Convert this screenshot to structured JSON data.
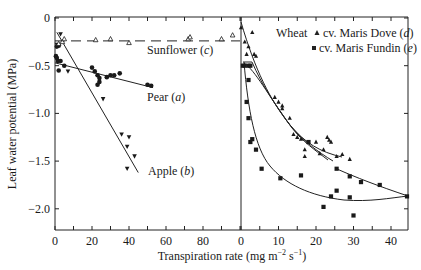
{
  "chart_data": {
    "type": "scatter",
    "title": "",
    "xlabel": "Transpiration rate (mg m⁻² s⁻¹)",
    "ylabel": "Leaf water potential (MPa)",
    "ylim": [
      -2.22,
      0
    ],
    "yticks": [
      0,
      -0.5,
      -1.0,
      -1.5,
      -2.0
    ],
    "ytick_labels": [
      "0",
      "−0.5",
      "−1.0",
      "−1.5",
      "−2.0"
    ],
    "grid": false,
    "panels": [
      {
        "name": "left",
        "xlim": [
          0,
          100
        ],
        "xticks": [
          0,
          20,
          40,
          60,
          80
        ],
        "xtick_labels": [
          "0",
          "20",
          "40",
          "60",
          "80"
        ],
        "series": [
          {
            "name": "Pear (a)",
            "marker": "circle-filled",
            "fit": "line",
            "fit_line": [
              [
                0,
                -0.47
              ],
              [
                53,
                -0.73
              ]
            ],
            "points": [
              [
                1,
                -0.3
              ],
              [
                2,
                -0.29
              ],
              [
                0.5,
                -0.4
              ],
              [
                1,
                -0.42
              ],
              [
                1.5,
                -0.45
              ],
              [
                3,
                -0.45
              ],
              [
                2,
                -0.55
              ],
              [
                5,
                -0.5
              ],
              [
                20,
                -0.52
              ],
              [
                21.5,
                -0.56
              ],
              [
                23,
                -0.6
              ],
              [
                24,
                -0.63
              ],
              [
                24,
                -0.67
              ],
              [
                23,
                -0.7
              ],
              [
                28,
                -0.62
              ],
              [
                30,
                -0.6
              ],
              [
                32,
                -0.6
              ],
              [
                35,
                -0.58
              ],
              [
                50,
                -0.7
              ],
              [
                52,
                -0.71
              ]
            ]
          },
          {
            "name": "Apple (b)",
            "marker": "triangle-down-filled",
            "fit": "line",
            "fit_line": [
              [
                1,
                -0.15
              ],
              [
                45,
                -1.62
              ]
            ],
            "points": [
              [
                3,
                -0.17
              ],
              [
                1,
                -0.28
              ],
              [
                7,
                -0.56
              ],
              [
                26,
                -0.85
              ],
              [
                36,
                -1.22
              ],
              [
                40,
                -1.25
              ],
              [
                39,
                -1.35
              ],
              [
                43,
                -1.45
              ],
              [
                39,
                -1.58
              ]
            ]
          },
          {
            "name": "Sunflower (c)",
            "marker": "triangle-up-open",
            "fit": "dashed-line",
            "fit_line": [
              [
                0,
                -0.24
              ],
              [
                100,
                -0.24
              ]
            ],
            "points": [
              [
                2,
                -0.27
              ],
              [
                4,
                -0.25
              ],
              [
                5,
                -0.22
              ],
              [
                22,
                -0.23
              ],
              [
                30,
                -0.22
              ],
              [
                40,
                -0.26
              ],
              [
                72,
                -0.22
              ],
              [
                73,
                -0.2
              ],
              [
                90,
                -0.22
              ],
              [
                96,
                -0.18
              ]
            ]
          }
        ]
      },
      {
        "name": "right",
        "panel_label": "Wheat",
        "xlim": [
          0,
          44.5
        ],
        "xticks": [
          0,
          10,
          20,
          30,
          40
        ],
        "xtick_labels": [
          "0",
          "10",
          "20",
          "30",
          "40"
        ],
        "series": [
          {
            "name": "cv. Maris Dove (d)",
            "marker": "triangle-up-filled",
            "fit": "curve",
            "points": [
              [
                0,
                -0.1
              ],
              [
                3,
                -0.15
              ],
              [
                1,
                -0.25
              ],
              [
                2,
                -0.3
              ],
              [
                1.5,
                -0.38
              ],
              [
                3.5,
                -0.38
              ],
              [
                4,
                -0.4
              ],
              [
                9,
                -0.83
              ],
              [
                10,
                -0.88
              ],
              [
                11,
                -0.92
              ],
              [
                11,
                -0.95
              ],
              [
                14,
                -1.22
              ],
              [
                15,
                -1.25
              ],
              [
                16,
                -1.27
              ],
              [
                13,
                -1.05
              ],
              [
                17,
                -1.38
              ],
              [
                17,
                -1.45
              ],
              [
                20,
                -1.3
              ],
              [
                21,
                -1.42
              ],
              [
                23,
                -1.25
              ],
              [
                23.5,
                -1.28
              ],
              [
                24,
                -1.3
              ],
              [
                22,
                -1.38
              ],
              [
                25.5,
                -1.45
              ],
              [
                27,
                -1.43
              ],
              [
                29,
                -1.48
              ]
            ]
          },
          {
            "name": "cv. Maris Fundin (e)",
            "marker": "square-filled",
            "fit": "curve",
            "points": [
              [
                0.5,
                -0.5
              ],
              [
                1,
                -0.5
              ],
              [
                2,
                -0.5
              ],
              [
                2.5,
                -0.5
              ],
              [
                2,
                -0.65
              ],
              [
                1.5,
                -0.88
              ],
              [
                2,
                -1.05
              ],
              [
                3,
                -1.27
              ],
              [
                2.5,
                -1.3
              ],
              [
                4,
                -1.38
              ],
              [
                5.5,
                -1.58
              ],
              [
                10.5,
                -1.68
              ],
              [
                16,
                -1.65
              ],
              [
                18,
                -1.3
              ],
              [
                24,
                -1.87
              ],
              [
                25.5,
                -1.81
              ],
              [
                22,
                -1.98
              ],
              [
                29,
                -1.88
              ],
              [
                30,
                -2.07
              ],
              [
                25.5,
                -1.58
              ],
              [
                29,
                -1.66
              ],
              [
                32,
                -1.72
              ],
              [
                37,
                -1.75
              ],
              [
                44.5,
                -1.87
              ]
            ]
          }
        ]
      }
    ],
    "legend": {
      "position": "upper right of right panel",
      "header": "Wheat",
      "entries": [
        "▲ cv. Maris Dove (d)",
        "■ cv. Maris Fundin (e)"
      ]
    },
    "annotations": [
      "Sunflower (c)",
      "Pear (a)",
      "Apple (b)"
    ]
  },
  "labels": {
    "ylabel": "Leaf water potential (MPa)",
    "xlabel_main": "Transpiration rate (mg m",
    "xlabel_exp1": "−2",
    "xlabel_mid": " s",
    "xlabel_exp2": "−1",
    "xlabel_end": ")",
    "sunflower": "Sunflower (",
    "sunflower_letter": "c",
    "pear": "Pear (",
    "pear_letter": "a",
    "apple": "Apple (",
    "apple_letter": "b",
    "close_paren": ")",
    "wheat": "Wheat",
    "dove": "cv. Maris Dove (",
    "dove_letter": "d",
    "fundin": "cv. Maris Fundin (",
    "fundin_letter": "e"
  }
}
